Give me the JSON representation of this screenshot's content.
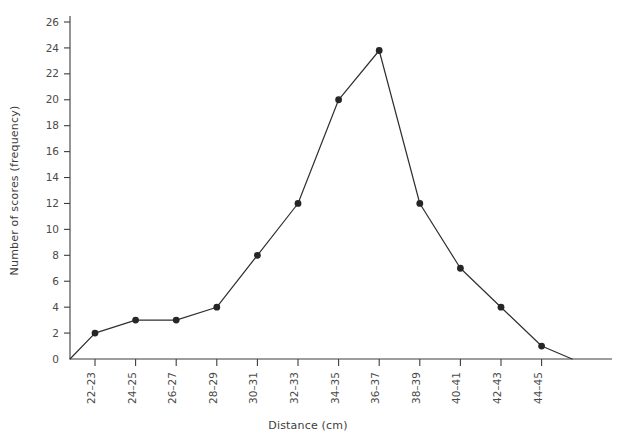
{
  "chart_data": {
    "type": "line",
    "title": "",
    "subtitle": "",
    "xlabel": "Distance (cm)",
    "ylabel": "Number of scores (frequency)",
    "categories": [
      "22–23",
      "24–25",
      "26–27",
      "28–29",
      "30–31",
      "32–33",
      "34–35",
      "36–37",
      "38–39",
      "40–41",
      "42–43",
      "44–45"
    ],
    "values": [
      2,
      3,
      3,
      4,
      8,
      12,
      20,
      23.8,
      12,
      7,
      4,
      1
    ],
    "ylim": [
      0,
      26
    ],
    "ytick_step": 2,
    "yticks": [
      0,
      2,
      4,
      6,
      8,
      10,
      12,
      14,
      16,
      18,
      20,
      22,
      24,
      26
    ],
    "ytick_labels": [
      "0",
      "2",
      "4",
      "6",
      "8",
      "10",
      "12",
      "14",
      "16",
      "18",
      "20",
      "22",
      "24",
      "26"
    ],
    "grid": false,
    "legend": "none",
    "marker": "filled-circle",
    "line_color": "#2f2f2f",
    "marker_color": "#262626",
    "axis_color": "#3c3c3c",
    "anchored_to_axis": true
  },
  "axes": {
    "x_title": "Distance (cm)",
    "y_title": "Number of scores (frequency)"
  }
}
